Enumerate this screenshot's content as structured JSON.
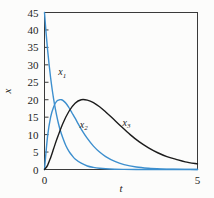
{
  "chart_data": {
    "type": "line",
    "title": "",
    "xlabel": "t",
    "ylabel": "x",
    "xlim": [
      0,
      5
    ],
    "ylim": [
      0,
      45
    ],
    "grid": false,
    "legend_position": "inline-annotations",
    "x_ticks": [
      "0",
      "5"
    ],
    "x_tick_values": [
      0,
      5
    ],
    "y_ticks": [
      "0",
      "5",
      "10",
      "15",
      "20",
      "25",
      "30",
      "35",
      "40",
      "45"
    ],
    "y_tick_values": [
      0,
      5,
      10,
      15,
      20,
      25,
      30,
      35,
      40,
      45
    ],
    "series": [
      {
        "name": "x1",
        "label_base": "x",
        "label_sub": "1",
        "color": "#3d8fce",
        "label_x": 0.45,
        "label_y": 27.0,
        "x": [
          0.0,
          0.05,
          0.1,
          0.15,
          0.2,
          0.25,
          0.3,
          0.35,
          0.4,
          0.45,
          0.5,
          0.6,
          0.7,
          0.8,
          0.9,
          1.0,
          1.2,
          1.4,
          1.6,
          1.8,
          2.0,
          2.3,
          2.6,
          3.0,
          3.5,
          4.0,
          4.5,
          5.0
        ],
        "values": [
          45.0,
          39.3,
          34.4,
          30.1,
          26.3,
          23.0,
          20.1,
          17.6,
          15.4,
          13.4,
          11.7,
          9.0,
          6.8,
          5.2,
          4.0,
          3.0,
          1.8,
          1.0,
          0.6,
          0.35,
          0.2,
          0.09,
          0.04,
          0.01,
          0.0,
          0.0,
          0.0,
          0.0
        ]
      },
      {
        "name": "x2",
        "label_base": "x",
        "label_sub": "2",
        "color": "#3d8fce",
        "label_x": 1.15,
        "label_y": 12.0,
        "peak_value": 20.0,
        "peak_t": 0.55,
        "x": [
          0.0,
          0.1,
          0.2,
          0.3,
          0.4,
          0.5,
          0.55,
          0.6,
          0.7,
          0.8,
          0.9,
          1.0,
          1.2,
          1.4,
          1.6,
          1.8,
          2.0,
          2.3,
          2.6,
          3.0,
          3.4,
          3.8,
          4.2,
          4.6,
          5.0
        ],
        "values": [
          0.0,
          9.5,
          15.0,
          18.0,
          19.6,
          20.0,
          20.0,
          19.8,
          19.0,
          17.7,
          16.2,
          14.7,
          11.6,
          8.9,
          6.7,
          5.0,
          3.7,
          2.3,
          1.4,
          0.7,
          0.35,
          0.17,
          0.08,
          0.04,
          0.02
        ]
      },
      {
        "name": "x3",
        "label_base": "x",
        "label_sub": "3",
        "color": "#1c1c1c",
        "label_x": 2.55,
        "label_y": 12.5,
        "peak_value": 20.0,
        "peak_t": 1.2,
        "x": [
          0.0,
          0.1,
          0.2,
          0.3,
          0.4,
          0.6,
          0.8,
          1.0,
          1.2,
          1.4,
          1.6,
          1.8,
          2.0,
          2.2,
          2.5,
          2.8,
          3.1,
          3.4,
          3.7,
          4.0,
          4.3,
          4.6,
          5.0
        ],
        "values": [
          0.0,
          1.2,
          3.4,
          6.0,
          8.6,
          13.2,
          16.7,
          19.0,
          20.0,
          19.9,
          19.2,
          18.0,
          16.5,
          14.9,
          12.4,
          10.0,
          7.9,
          6.2,
          4.8,
          3.7,
          2.9,
          2.2,
          1.6
        ]
      }
    ]
  }
}
